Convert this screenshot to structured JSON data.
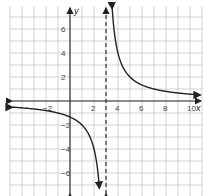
{
  "chart_data": {
    "type": "line",
    "title": "",
    "xlabel": "x",
    "ylabel": "y",
    "xlim": [
      -5,
      11
    ],
    "ylim": [
      -8,
      8
    ],
    "grid": true,
    "x_ticks": [
      -2,
      2,
      4,
      6,
      8,
      10
    ],
    "y_ticks": [
      6,
      4,
      2,
      -2,
      -4,
      -6
    ],
    "x_tick_labels": [
      "−2",
      "2",
      "4",
      "6",
      "8",
      "10"
    ],
    "y_tick_labels": [
      "6",
      "4",
      "2",
      "−2",
      "−4",
      "−6"
    ],
    "function": "y = 4/(x - 3)",
    "vertical_asymptote": 3,
    "horizontal_asymptote": 0,
    "series": [
      {
        "name": "left branch",
        "x": [
          -5,
          -2,
          0,
          1,
          2,
          2.5
        ],
        "y": [
          -0.5,
          -0.8,
          -1.33,
          -2,
          -4,
          -8
        ]
      },
      {
        "name": "right branch",
        "x": [
          3.5,
          4,
          5,
          6,
          8,
          10
        ],
        "y": [
          8,
          4,
          2,
          1.33,
          0.8,
          0.57
        ]
      }
    ],
    "colors": {
      "curve": "#222222",
      "grid": "#c8c8c8",
      "axis": "#333333",
      "asymptote": "#333333"
    }
  }
}
